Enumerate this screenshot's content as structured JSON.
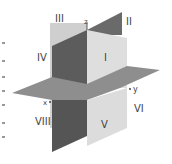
{
  "diagram": {
    "axes": {
      "z": "z",
      "y": "y",
      "x": "x"
    },
    "octants": [
      "I",
      "II",
      "III",
      "IV",
      "V",
      "VI",
      "VIII"
    ],
    "colors": {
      "light_plane": "#d9d9d9",
      "dark_plane": "#5a5a5a",
      "horizontal_plane": "#8c8c8c",
      "label": "#444444"
    }
  }
}
